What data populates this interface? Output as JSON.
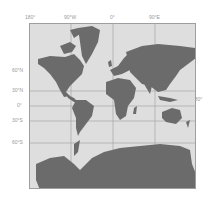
{
  "map": {
    "projection": "Mercator world map",
    "colors": {
      "ocean": "#dedede",
      "land": "#6b6b6b",
      "grid": "#a8a8a8",
      "frame": "#9e9e9e",
      "label": "#9a9a9a"
    },
    "longitude_labels": [
      "180°",
      "90°W",
      "0°",
      "90°E"
    ],
    "latitude_labels": [
      "60°N",
      "30°N",
      "0°",
      "30°S",
      "60°S"
    ],
    "right_edge_label": "180°"
  }
}
